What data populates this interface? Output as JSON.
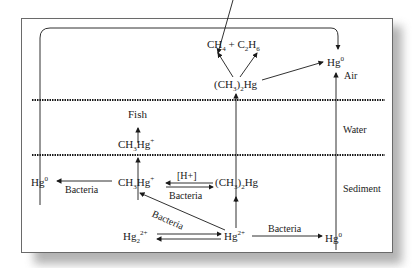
{
  "diagram": {
    "title": "",
    "zones": [
      {
        "name": "Air"
      },
      {
        "name": "Water"
      },
      {
        "name": "Sediment"
      }
    ],
    "nodes": {
      "ch4_c2h6": {
        "main": "CH",
        "s1": "4",
        "mid": " + C",
        "s2": "2",
        "end": "H",
        "s3": "6"
      },
      "dmhg_air": {
        "a": "(CH",
        "s": "3",
        "b": ")",
        "s2": "2",
        "c": "Hg"
      },
      "hg0_air": {
        "a": "Hg",
        "sup": "0"
      },
      "fish": "Fish",
      "mehg_water": {
        "a": "CH",
        "s": "3",
        "b": "Hg",
        "sup": "+"
      },
      "hg0_sed_left": {
        "a": "Hg",
        "sup": "0"
      },
      "mehg_sed": {
        "a": "CH",
        "s": "3",
        "b": "Hg",
        "sup": "+"
      },
      "dmhg_sed": {
        "a": "(CH",
        "s": "3",
        "b": ")",
        "s2": "2",
        "c": "Hg"
      },
      "hg22": {
        "a": "Hg",
        "s": "2",
        "sup": "2+"
      },
      "hg2": {
        "a": "Hg",
        "sup": "2+"
      },
      "hg0_sed_right": {
        "a": "Hg",
        "sup": "0"
      }
    },
    "edge_labels": {
      "h_plus": "[H+]",
      "bacteria_left": "Bacteria",
      "bacteria_mid": "Bacteria",
      "bacteria_diag": "Bacteria",
      "bacteria_right": "Bacteria"
    },
    "colors": {
      "line": "#1a1a1a",
      "frame": "#6a6a6a",
      "shadow": "#9a9a9a"
    }
  }
}
